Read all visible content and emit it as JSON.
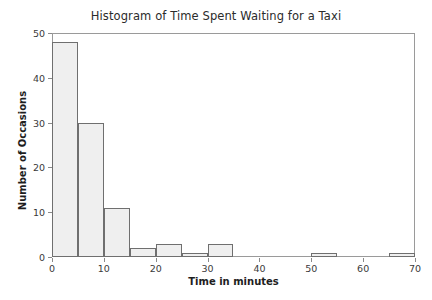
{
  "chart_data": {
    "type": "bar",
    "title": "Histogram of Time Spent Waiting for a Taxi",
    "xlabel": "Time in minutes",
    "ylabel": "Number of Occasions",
    "xlim": [
      0,
      70
    ],
    "ylim": [
      0,
      50
    ],
    "grid": false,
    "legend": null,
    "bin_width": 5,
    "bins": [
      {
        "start": 0,
        "end": 5,
        "count": 48
      },
      {
        "start": 5,
        "end": 10,
        "count": 30
      },
      {
        "start": 10,
        "end": 15,
        "count": 11
      },
      {
        "start": 15,
        "end": 20,
        "count": 2
      },
      {
        "start": 20,
        "end": 25,
        "count": 3
      },
      {
        "start": 25,
        "end": 30,
        "count": 1
      },
      {
        "start": 30,
        "end": 35,
        "count": 3
      },
      {
        "start": 35,
        "end": 40,
        "count": 0
      },
      {
        "start": 40,
        "end": 45,
        "count": 0
      },
      {
        "start": 45,
        "end": 50,
        "count": 0
      },
      {
        "start": 50,
        "end": 55,
        "count": 1
      },
      {
        "start": 55,
        "end": 60,
        "count": 0
      },
      {
        "start": 60,
        "end": 65,
        "count": 0
      },
      {
        "start": 65,
        "end": 70,
        "count": 1
      }
    ],
    "categories": [
      "0-5",
      "5-10",
      "10-15",
      "15-20",
      "20-25",
      "25-30",
      "30-35",
      "35-40",
      "40-45",
      "45-50",
      "50-55",
      "55-60",
      "60-65",
      "65-70"
    ],
    "values": [
      48,
      30,
      11,
      2,
      3,
      1,
      3,
      0,
      0,
      0,
      1,
      0,
      0,
      1
    ],
    "x_ticks": [
      {
        "value": 0,
        "label": "0"
      },
      {
        "value": 10,
        "label": "10"
      },
      {
        "value": 20,
        "label": "20"
      },
      {
        "value": 30,
        "label": "30"
      },
      {
        "value": 40,
        "label": "40"
      },
      {
        "value": 50,
        "label": "50"
      },
      {
        "value": 60,
        "label": "60"
      },
      {
        "value": 70,
        "label": "70"
      }
    ],
    "y_ticks": [
      {
        "value": 0,
        "label": "0"
      },
      {
        "value": 10,
        "label": "10"
      },
      {
        "value": 20,
        "label": "20"
      },
      {
        "value": 30,
        "label": "30"
      },
      {
        "value": 40,
        "label": "40"
      },
      {
        "value": 50,
        "label": "50"
      }
    ],
    "colors": {
      "bar_fill": "#efefef",
      "bar_stipple": "#b9b9b9",
      "bar_border": "#6f6f6f",
      "axis": "#9a9a9a",
      "text": "#2b2b2b",
      "background": "#ffffff"
    }
  }
}
